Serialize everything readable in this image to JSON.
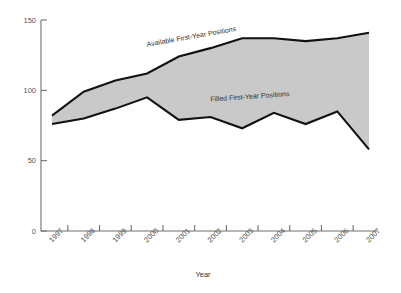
{
  "chart_data": {
    "type": "area",
    "title": "",
    "xlabel": "Year",
    "ylabel": "",
    "categories": [
      "1997",
      "1998",
      "1999",
      "2000",
      "2001",
      "2002",
      "2003",
      "2004",
      "2005",
      "2006",
      "2007"
    ],
    "ylim": [
      0,
      150
    ],
    "xlim": [
      "1997",
      "2007"
    ],
    "yticks": [
      "0",
      "50",
      "100",
      "150"
    ],
    "ytick_values": [
      0,
      50,
      100,
      150
    ],
    "grid": false,
    "legend": "inline-annotations",
    "series": [
      {
        "name": "Available First-Year Positions",
        "values": [
          82,
          99,
          107,
          112,
          124,
          130,
          137,
          137,
          135,
          137,
          141
        ]
      },
      {
        "name": "Filled First-Year Positions",
        "values": [
          76,
          80,
          87,
          95,
          79,
          81,
          73,
          84,
          76,
          85,
          58
        ]
      }
    ],
    "annotations": [
      {
        "text": "Available First-Year Positions",
        "x": "2000",
        "y": 131,
        "rotation": -10
      },
      {
        "text": "Filled First-Year Positions",
        "x": "2002",
        "y": 92,
        "rotation": -4
      }
    ],
    "band_fill_color": "#c9c9c9",
    "line_color": "#111111",
    "axis_color": "#6f6f6f"
  },
  "axis": {
    "x_title": "Year",
    "y_ticks": [
      "150",
      "100",
      "50",
      "0"
    ]
  },
  "labels": {
    "available": "Available First-Year Positions",
    "filled": "Filled First-Year Positions"
  }
}
